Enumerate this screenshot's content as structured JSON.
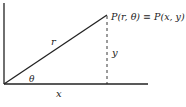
{
  "diagram": {
    "type": "polar-cartesian-relation",
    "point_label": "P(r, θ) ≡ P(x, y)",
    "radius_label": "r",
    "angle_label": "θ",
    "x_label": "x",
    "y_label": "y",
    "colors": {
      "line": "#222222",
      "background": "#ffffff"
    }
  }
}
